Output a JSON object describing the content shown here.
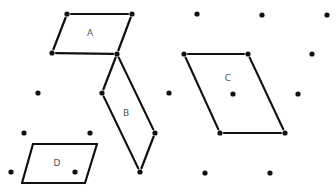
{
  "diagram": {
    "title": "",
    "type": "lattice-parallelograms",
    "colors": {
      "ink": "#111111",
      "label": "#555555",
      "background": "#ffffff"
    },
    "lattice_points": [
      [
        67,
        14
      ],
      [
        132,
        14
      ],
      [
        197,
        14
      ],
      [
        262,
        15
      ],
      [
        327,
        15
      ],
      [
        52,
        53
      ],
      [
        117,
        54
      ],
      [
        184,
        54
      ],
      [
        248,
        54
      ],
      [
        312,
        54
      ],
      [
        38,
        93
      ],
      [
        102,
        93
      ],
      [
        169,
        93
      ],
      [
        233,
        94
      ],
      [
        298,
        94
      ],
      [
        24,
        133
      ],
      [
        90,
        133
      ],
      [
        155,
        133
      ],
      [
        220,
        133
      ],
      [
        285,
        133
      ],
      [
        11,
        172
      ],
      [
        75,
        172
      ],
      [
        140,
        172
      ],
      [
        205,
        173
      ],
      [
        270,
        173
      ]
    ],
    "shapes": [
      {
        "label": "A",
        "vertices": [
          [
            67,
            14
          ],
          [
            132,
            14
          ],
          [
            117,
            54
          ],
          [
            52,
            53
          ]
        ],
        "label_pos": [
          90,
          36
        ]
      },
      {
        "label": "B",
        "vertices": [
          [
            117,
            54
          ],
          [
            155,
            133
          ],
          [
            140,
            172
          ],
          [
            102,
            93
          ]
        ],
        "label_pos": [
          126,
          116
        ]
      },
      {
        "label": "C",
        "vertices": [
          [
            184,
            54
          ],
          [
            248,
            54
          ],
          [
            285,
            133
          ],
          [
            220,
            133
          ]
        ],
        "label_pos": [
          228,
          81
        ]
      },
      {
        "label": "D",
        "vertices": [
          [
            33,
            144
          ],
          [
            97,
            144
          ],
          [
            85,
            183
          ],
          [
            22,
            183
          ]
        ],
        "label_pos": [
          57,
          166
        ]
      }
    ]
  }
}
